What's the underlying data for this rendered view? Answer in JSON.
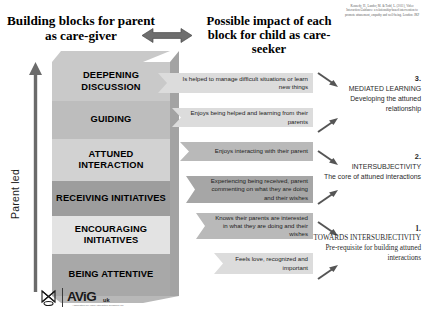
{
  "header": {
    "left_title": "Building blocks for parent as care-giver",
    "right_title": "Possible impact of each block for child as care-seeker",
    "arrow_icon": "double-headed-horizontal-arrow"
  },
  "citation": "Kennedy, H., Landor, M. & Todd, L. (2011), Video Interaction Guidance: a relationship-based intervention to promote attunement, empathy and well-being. London: JKP",
  "axis": {
    "label": "Parent led",
    "icon": "up-arrow"
  },
  "blocks": [
    {
      "label": "DEEPENING DISCUSSION",
      "tone": "#c9c9c9"
    },
    {
      "label": "GUIDING",
      "tone": "#bdbdbd"
    },
    {
      "label": "ATTUNED INTERACTION",
      "tone": "#d2d2d2"
    },
    {
      "label": "RECEIVING INITIATIVES",
      "tone": "#9d9d9d"
    },
    {
      "label": "ENCOURAGING INITIATIVES",
      "tone": "#e3e3e3"
    },
    {
      "label": "BEING ATTENTIVE",
      "tone": "#a8a8a8"
    }
  ],
  "callouts": [
    {
      "text": "Is helped to manage difficult situations or learn new things",
      "tone": "light"
    },
    {
      "text": "Enjoys being helped and learning from their parents",
      "tone": "light"
    },
    {
      "text": "Enjoys interacting with their parent",
      "tone": "mid"
    },
    {
      "text": "Experiencing being received, parent commenting on what they are doing and their wishes",
      "tone": "dark"
    },
    {
      "text": "Knows their parents are interested in what they are doing and their wishes",
      "tone": "mid"
    },
    {
      "text": "Feels love, recognized and important",
      "tone": "light"
    }
  ],
  "notes": [
    {
      "number": "3.",
      "heading": "MEDIATED LEARNING",
      "body": "Developing the attuned relationship"
    },
    {
      "number": "2.",
      "heading": "INTERSUBJECTIVITY",
      "body": "The core of attuned interactions"
    },
    {
      "number": "1.",
      "heading": "TOWARDS INTERSUBJECTIVITY",
      "body": "Pre-requisite for building attuned interactions"
    }
  ],
  "logo": {
    "mark": "butterfly-mark-icon",
    "name": "AViG",
    "suffix": "uk",
    "subtitle": "Association for Video Interaction Guidance UK"
  }
}
